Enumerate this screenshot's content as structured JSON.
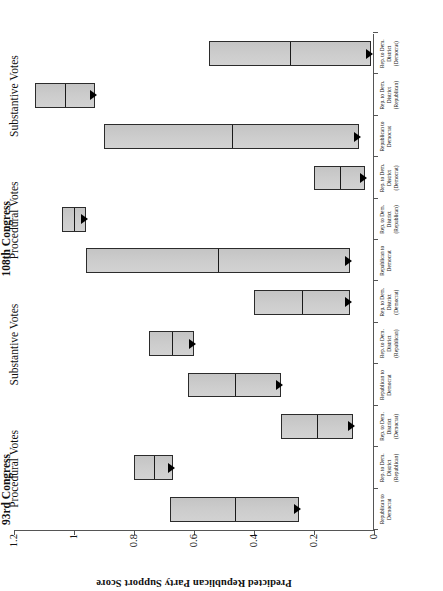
{
  "chart_data": {
    "type": "bar",
    "title": "",
    "xlabel": "",
    "ylabel": "Predicted Republican Party Support Score",
    "ylim": [
      0,
      1.2
    ],
    "yticks": [
      "0",
      "0.2",
      "0.4",
      "0.6",
      "0.8",
      "1",
      "1.2"
    ],
    "ytick_values": [
      0,
      0.2,
      0.4,
      0.6,
      0.8,
      1,
      1.2
    ],
    "grid": false,
    "legend": "none",
    "orientation": "rotated-90",
    "note": "Floating range bars; arrow marks the predicted endpoint (lower value).",
    "congresses": [
      {
        "name": "93rd Congress",
        "vote_types": [
          {
            "name": "Procedural Votes",
            "categories": [
              "Republican to Democrat",
              "Rep. to Dem. District (Republican)",
              "Rep. to Dem. District (Democrat)"
            ],
            "bars": [
              {
                "label": "Republican to Democrat",
                "high": 0.68,
                "low": 0.25
              },
              {
                "label": "Rep. to Dem. District (Republican)",
                "high": 0.8,
                "low": 0.67
              },
              {
                "label": "Rep. to Dem. District (Democrat)",
                "high": 0.31,
                "low": 0.07
              }
            ]
          },
          {
            "name": "Substantive Votes",
            "categories": [
              "Republican to Democrat",
              "Rep. to Dem. District (Republican)",
              "Rep. to Dem. District (Democrat)"
            ],
            "bars": [
              {
                "label": "Republican to Democrat",
                "high": 0.62,
                "low": 0.31
              },
              {
                "label": "Rep. to Dem. District (Republican)",
                "high": 0.75,
                "low": 0.6
              },
              {
                "label": "Rep. to Dem. District (Democrat)",
                "high": 0.4,
                "low": 0.08
              }
            ]
          }
        ]
      },
      {
        "name": "108th Congress",
        "vote_types": [
          {
            "name": "Procedural Votes",
            "categories": [
              "Republican to Democrat",
              "Rep. to Dem. District (Republican)",
              "Rep. to Dem. District (Democrat)"
            ],
            "bars": [
              {
                "label": "Republican to Democrat",
                "high": 0.96,
                "low": 0.08
              },
              {
                "label": "Rep. to Dem. District (Republican)",
                "high": 1.04,
                "low": 0.96
              },
              {
                "label": "Rep. to Dem. District (Democrat)",
                "high": 0.2,
                "low": 0.03
              }
            ]
          },
          {
            "name": "Substantive Votes",
            "categories": [
              "Republican to Democrat",
              "Rep. to Dem. District (Republican)",
              "Rep. to Dem. District (Democrat)"
            ],
            "bars": [
              {
                "label": "Republican to Democrat",
                "high": 0.9,
                "low": 0.05
              },
              {
                "label": "Rep. to Dem. District (Republican)",
                "high": 1.13,
                "low": 0.93
              },
              {
                "label": "Rep. to Dem. District (Democrat)",
                "high": 0.55,
                "low": 0.01
              }
            ]
          }
        ]
      }
    ]
  },
  "axis": {
    "value_title": "Predicted Republican Party Support Score",
    "tick_labels": [
      "1.2",
      "1",
      "0.8",
      "0.6",
      "0.4",
      "0.2",
      "0"
    ]
  },
  "groups": {
    "congress_93": "93rd Congress",
    "congress_108": "108th Congress",
    "procedural": "Procedural Votes",
    "substantive": "Substantive Votes"
  },
  "categories": {
    "rep_to_dem": "Republican to Democrat",
    "district_rep": "Rep. to Dem. District (Republican)",
    "district_dem": "Rep. to Dem. District (Democrat)"
  },
  "category_lines": {
    "rep_to_dem_l1": "Republican to",
    "rep_to_dem_l2": "Democrat",
    "district_rep_l1": "Rep. to Dem.",
    "district_rep_l2": "District",
    "district_rep_l3": "(Republican)",
    "district_dem_l1": "Rep. to Dem.",
    "district_dem_l2": "District",
    "district_dem_l3": "(Democrat)"
  }
}
